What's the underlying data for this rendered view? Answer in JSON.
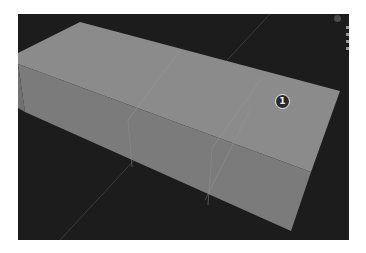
{
  "viewport": {
    "background": "#1c1c1c",
    "object": "box-mesh",
    "faces": {
      "top": "#8a8a8a",
      "front": "#7a7a7a",
      "side": "#727272"
    },
    "grid_line_color": "#4a4a4a"
  },
  "marker": {
    "label": "1"
  }
}
